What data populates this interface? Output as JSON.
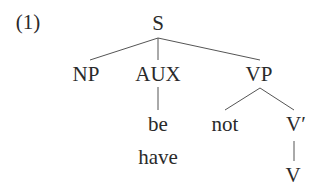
{
  "example_number": "(1)",
  "tree": {
    "root": "S",
    "children": [
      "NP",
      "AUX",
      "VP"
    ],
    "aux_words": [
      "be",
      "have"
    ],
    "vp_children": [
      "not",
      "V′"
    ],
    "vbar_child": "V"
  },
  "nodes": {
    "S": "S",
    "NP": "NP",
    "AUX": "AUX",
    "VP": "VP",
    "be": "be",
    "have": "have",
    "not": "not",
    "Vbar": "V′",
    "V": "V"
  },
  "colors": {
    "text": "#2a2a2a",
    "line": "#555555",
    "background": "#ffffff"
  }
}
